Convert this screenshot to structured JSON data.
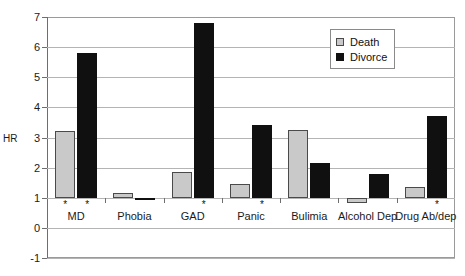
{
  "chart_data": {
    "type": "bar",
    "title": "",
    "xlabel": "",
    "ylabel": "HR",
    "ylim": [
      -1,
      7
    ],
    "yticks": [
      7,
      6,
      5,
      4,
      3,
      2,
      1,
      0,
      -1
    ],
    "baseline": 1,
    "grid": true,
    "legend_position": "top-right",
    "categories": [
      "MD",
      "Phobia",
      "GAD",
      "Panic",
      "Bulimia",
      "Alcohol Dep",
      "Drug Ab/dep"
    ],
    "series": [
      {
        "name": "Death",
        "color": "#c9c9c9",
        "values": [
          3.2,
          1.15,
          1.85,
          1.45,
          3.25,
          0.82,
          1.35
        ],
        "significant": [
          true,
          false,
          false,
          false,
          false,
          false,
          false
        ]
      },
      {
        "name": "Divorce",
        "color": "#101010",
        "values": [
          5.8,
          0.97,
          6.8,
          3.4,
          2.15,
          1.78,
          3.7
        ],
        "significant": [
          true,
          false,
          true,
          true,
          false,
          false,
          true
        ]
      }
    ],
    "significance_marker": "*"
  },
  "axis": {
    "y_title": "HR",
    "tick_labels": [
      "7",
      "6",
      "5",
      "4",
      "3",
      "2",
      "1",
      "0",
      "-1"
    ]
  },
  "legend": {
    "entries": [
      {
        "label": "Death",
        "swatch": "death-swatch"
      },
      {
        "label": "Divorce",
        "swatch": "divorce-swatch"
      }
    ]
  }
}
